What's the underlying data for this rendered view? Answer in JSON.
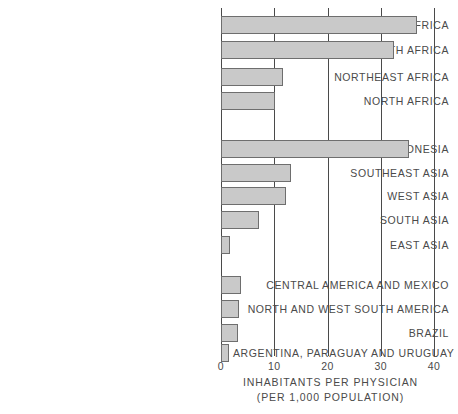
{
  "chart_data": {
    "type": "bar",
    "orientation": "horizontal",
    "title": "",
    "xlabel": "INHABITANTS PER PHYSICIAN",
    "xlabel_sub": "(PER 1,000 POPULATION)",
    "ylabel": "",
    "xlim": [
      0,
      40
    ],
    "ticks": [
      "0",
      "10",
      "20",
      "30",
      "40"
    ],
    "tick_values": [
      0,
      10,
      20,
      30,
      40
    ],
    "grid": true,
    "legend": "none",
    "bar_color": "#c9c9c9",
    "bar_border_color": "#6e6e6e",
    "axis_color": "#4a4a4a",
    "groups": [
      {
        "name": "africa",
        "categories": [
          "WEST AND CENTRAL AFRICA",
          "EAST AND SOUTH AFRICA",
          "NORTHEAST AFRICA",
          "NORTH AFRICA"
        ],
        "values": [
          36.8,
          32.4,
          11.6,
          10.1
        ]
      },
      {
        "name": "asia",
        "categories": [
          "INDONESIA",
          "SOUTHEAST ASIA",
          "WEST ASIA",
          "SOUTH ASIA",
          "EAST ASIA"
        ],
        "values": [
          35.3,
          13.1,
          12.2,
          7.1,
          1.7
        ]
      },
      {
        "name": "latin-america",
        "categories": [
          "CENTRAL AMERICA AND MEXICO",
          "NORTH AND WEST SOUTH AMERICA",
          "BRAZIL",
          "ARGENTINA, PARAGUAY AND URUGUAY"
        ],
        "values": [
          3.8,
          3.4,
          3.2,
          1.5
        ]
      }
    ],
    "categories": [
      "WEST AND CENTRAL AFRICA",
      "EAST AND SOUTH AFRICA",
      "NORTHEAST AFRICA",
      "NORTH AFRICA",
      "INDONESIA",
      "SOUTHEAST ASIA",
      "WEST ASIA",
      "SOUTH ASIA",
      "EAST ASIA",
      "CENTRAL AMERICA AND MEXICO",
      "NORTH AND WEST SOUTH AMERICA",
      "BRAZIL",
      "ARGENTINA, PARAGUAY AND URUGUAY"
    ],
    "values": [
      36.8,
      32.4,
      11.6,
      10.1,
      35.3,
      13.1,
      12.2,
      7.1,
      1.7,
      3.8,
      3.4,
      3.2,
      1.5
    ]
  },
  "rows": [
    {
      "label": "WEST AND CENTRAL AFRICA",
      "value": 36.8,
      "top": 16
    },
    {
      "label": "EAST AND SOUTH AFRICA",
      "value": 32.4,
      "top": 41
    },
    {
      "label": "NORTHEAST AFRICA",
      "value": 11.6,
      "top": 68
    },
    {
      "label": "NORTH AFRICA",
      "value": 10.1,
      "top": 92
    },
    {
      "label": "INDONESIA",
      "value": 35.3,
      "top": 140
    },
    {
      "label": "SOUTHEAST ASIA",
      "value": 13.1,
      "top": 164
    },
    {
      "label": "WEST ASIA",
      "value": 12.2,
      "top": 187
    },
    {
      "label": "SOUTH ASIA",
      "value": 7.1,
      "top": 211
    },
    {
      "label": "EAST ASIA",
      "value": 1.7,
      "top": 236
    },
    {
      "label": "CENTRAL AMERICA AND MEXICO",
      "value": 3.8,
      "top": 276
    },
    {
      "label": "NORTH AND WEST SOUTH AMERICA",
      "value": 3.4,
      "top": 300
    },
    {
      "label": "BRAZIL",
      "value": 3.2,
      "top": 324
    },
    {
      "label": "ARGENTINA, PARAGUAY AND URUGUAY",
      "value": 1.5,
      "top": 344
    }
  ]
}
